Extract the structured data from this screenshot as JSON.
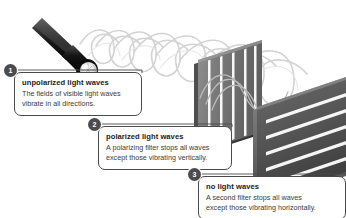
{
  "diagram": {
    "callouts": [
      {
        "number": "1",
        "title": "unpolarized light waves",
        "lines": [
          "The fields of visible light waves",
          "vibrate in all directions."
        ]
      },
      {
        "number": "2",
        "title": "polarized light waves",
        "lines": [
          "A polarizing filter stops all waves",
          "except those vibrating vertically."
        ]
      },
      {
        "number": "3",
        "title": "no light waves",
        "lines": [
          "A second filter stops all waves",
          "except those vibrating horizontally."
        ]
      }
    ],
    "objects": {
      "flashlight": "flashlight-icon",
      "first_filter": "vertical-slit-polarizing-filter",
      "second_filter": "horizontal-slit-polarizing-filter",
      "incoming_waves": "helical-unpolarized-light-waves",
      "middle_waves": "planar-vertically-polarized-light-waves"
    },
    "colors": {
      "background": "#ffffff",
      "badge": "#4c4c4c",
      "badge_text": "#ffffff",
      "callout_border": "#4a4a4a",
      "title_text": "#1c1c1c",
      "body_text": "#3b3b3b",
      "flashlight_body": "#2b2b2b",
      "flashlight_lens": "#f2f2f2",
      "filter_one": "#7d7d7d",
      "filter_two": "#5a5a5a",
      "wave": "#cfcfcf"
    }
  }
}
